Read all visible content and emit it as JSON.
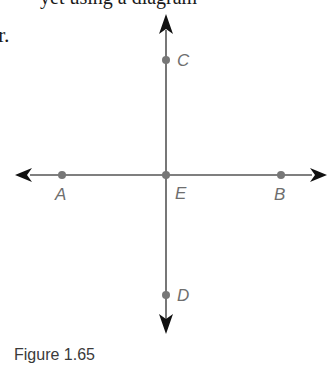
{
  "header": {
    "cut_text": "yet using a diagram",
    "fragment": "r."
  },
  "figure": {
    "caption": "Figure 1.65",
    "line_color": "#555555",
    "arrow_color": "#111111",
    "point_color": "#777777",
    "points": {
      "A": {
        "label": "A",
        "x": 62,
        "y": 175
      },
      "B": {
        "label": "B",
        "x": 281,
        "y": 175
      },
      "C": {
        "label": "C",
        "x": 166,
        "y": 60
      },
      "D": {
        "label": "D",
        "x": 166,
        "y": 295
      },
      "E": {
        "label": "E",
        "x": 166,
        "y": 175
      }
    }
  }
}
